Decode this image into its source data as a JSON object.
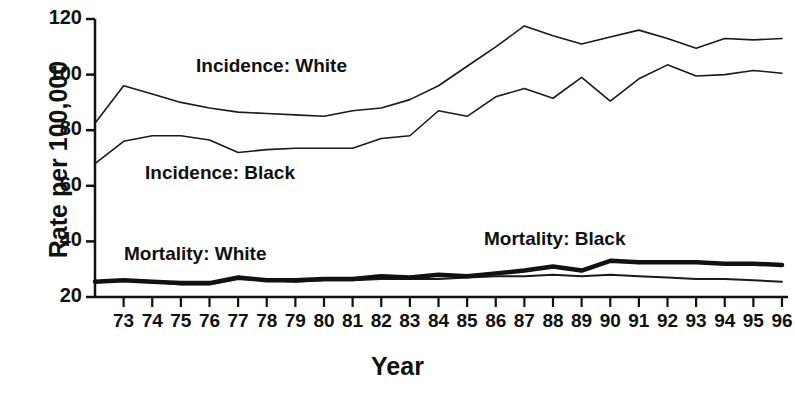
{
  "chart_data": {
    "type": "line",
    "title": "",
    "xlabel": "Year",
    "ylabel": "Rate per 100,000",
    "xlim": [
      72,
      96
    ],
    "ylim": [
      20,
      120
    ],
    "yticks": [
      20,
      40,
      60,
      80,
      100,
      120
    ],
    "xticks": [
      73,
      74,
      75,
      76,
      77,
      78,
      79,
      80,
      81,
      82,
      83,
      84,
      85,
      86,
      87,
      88,
      89,
      90,
      91,
      92,
      93,
      94,
      95,
      96
    ],
    "xtick_labels": [
      "73",
      "74",
      "75",
      "76",
      "77",
      "78",
      "79",
      "80",
      "81",
      "82",
      "83",
      "84",
      "85",
      "86",
      "87",
      "88",
      "89",
      "90",
      "91",
      "92",
      "93",
      "94",
      "95",
      "96"
    ],
    "grid": false,
    "legend": "inline-annotations",
    "x": [
      72,
      73,
      74,
      75,
      76,
      77,
      78,
      79,
      80,
      81,
      82,
      83,
      84,
      85,
      86,
      87,
      88,
      89,
      90,
      91,
      92,
      93,
      94,
      95,
      96
    ],
    "series": [
      {
        "name": "Incidence: White",
        "color": "#1a1a1a",
        "line_width": 1.6,
        "values": [
          82.5,
          96.0,
          93.0,
          90.0,
          88.0,
          86.5,
          86.0,
          85.5,
          85.0,
          87.0,
          88.0,
          91.0,
          96.0,
          103.0,
          110.0,
          117.5,
          114.0,
          111.0,
          113.5,
          116.0,
          113.0,
          109.5,
          113.0,
          112.5,
          113.0
        ]
      },
      {
        "name": "Incidence: Black",
        "color": "#1a1a1a",
        "line_width": 1.6,
        "values": [
          68.0,
          76.0,
          78.0,
          78.0,
          76.5,
          72.0,
          73.0,
          73.5,
          73.5,
          73.5,
          77.0,
          78.0,
          87.0,
          85.0,
          92.0,
          95.0,
          91.5,
          99.0,
          90.5,
          98.5,
          103.5,
          99.5,
          100.0,
          101.5,
          100.5
        ]
      },
      {
        "name": "Mortality: White",
        "color": "#1a1a1a",
        "line_width": 2.0,
        "values": [
          25.5,
          26.0,
          25.5,
          24.5,
          24.5,
          26.5,
          26.0,
          25.5,
          26.0,
          26.0,
          26.5,
          26.5,
          26.5,
          27.0,
          27.5,
          27.5,
          28.0,
          27.5,
          28.0,
          27.5,
          27.0,
          26.5,
          26.5,
          26.0,
          25.5
        ]
      },
      {
        "name": "Mortality: Black",
        "color": "#111111",
        "line_width": 4.5,
        "values": [
          25.5,
          26.0,
          25.5,
          25.0,
          25.0,
          27.0,
          26.0,
          26.0,
          26.5,
          26.5,
          27.5,
          27.0,
          28.0,
          27.5,
          28.5,
          29.5,
          31.0,
          29.5,
          33.0,
          32.5,
          32.5,
          32.5,
          32.0,
          32.0,
          31.5
        ]
      }
    ],
    "annotations": [
      {
        "text": "Incidence: White",
        "x_px": 196,
        "y_px": 55
      },
      {
        "text": "Incidence: Black",
        "x_px": 145,
        "y_px": 162
      },
      {
        "text": "Mortality: White",
        "x_px": 124,
        "y_px": 243
      },
      {
        "text": "Mortality: Black",
        "x_px": 484,
        "y_px": 228
      }
    ]
  }
}
